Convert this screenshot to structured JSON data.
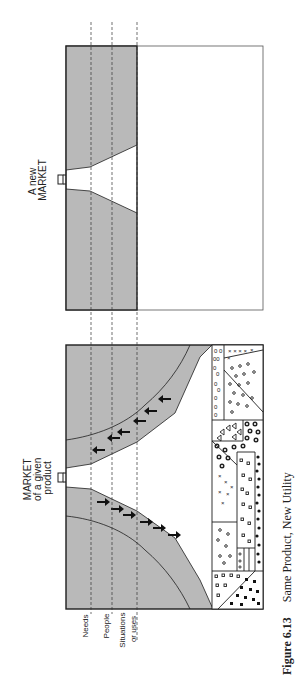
{
  "figure": {
    "number": "Figure 6.13",
    "caption": "Same Product, New Utility",
    "orientation": "rotated-90-ccw"
  },
  "axis_labels": [
    {
      "lines": [
        "Needs"
      ]
    },
    {
      "lines": [
        "People"
      ]
    },
    {
      "lines": [
        "Situations",
        "or uses"
      ]
    }
  ],
  "left_panel": {
    "label_lines": [
      "MARKET",
      "of a given",
      "product"
    ],
    "upward_arrows": 6,
    "downward_arrows": 6
  },
  "right_panel": {
    "label_lines": [
      "A new",
      "MARKET"
    ]
  },
  "colors": {
    "shade": "#b9b9b9",
    "line": "#1e1e1e",
    "paper": "#ffffff"
  }
}
